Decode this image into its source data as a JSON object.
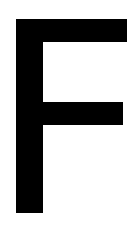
{
  "glyph": {
    "character": "F",
    "color": "#000000",
    "background": "#ffffff"
  }
}
